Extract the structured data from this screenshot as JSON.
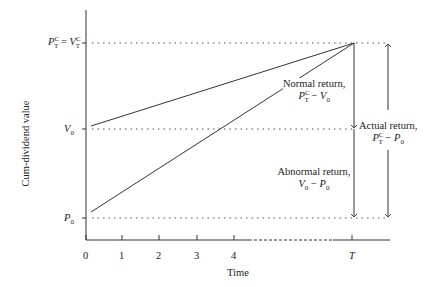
{
  "diagram": {
    "type": "value-over-time",
    "y_axis": {
      "label": "Cum-dividend value",
      "levels": [
        {
          "id": "top",
          "label_main": "P",
          "label_sup": "C",
          "label_sub": "T",
          "eq": " = ",
          "label2_main": "V",
          "label2_sup": "C",
          "label2_sub": "T"
        },
        {
          "id": "v0",
          "label_main": "V",
          "label_sub": "0"
        },
        {
          "id": "p0",
          "label_main": "P",
          "label_sub": "0"
        }
      ]
    },
    "x_axis": {
      "label": "Time",
      "ticks": [
        "0",
        "1",
        "2",
        "3",
        "4",
        "T"
      ],
      "dashed_segment": "between 4 and T"
    },
    "lines": [
      {
        "name": "value-path",
        "from": "V0 at t=0",
        "to": "P_T^C at T"
      },
      {
        "name": "price-path",
        "from": "P0 at t=0",
        "to": "P_T^C at T"
      }
    ],
    "annotations": {
      "normal": {
        "line1": "Normal return,",
        "formula_a": "P",
        "formula_a_sup": "C",
        "formula_a_sub": "T",
        "formula_op": " − ",
        "formula_b": "V",
        "formula_b_sub": "0"
      },
      "abnormal": {
        "line1": "Abnormal return,",
        "formula_a": "V",
        "formula_a_sub": "0",
        "formula_op": " − ",
        "formula_b": "P",
        "formula_b_sub": "0"
      },
      "actual": {
        "line1": "Actual return,",
        "formula_a": "P",
        "formula_a_sup": "C",
        "formula_a_sub": "T",
        "formula_op": " − ",
        "formula_b": "P",
        "formula_b_sub": "0"
      }
    },
    "colors": {
      "ink": "#333333",
      "background": "#ffffff"
    }
  }
}
